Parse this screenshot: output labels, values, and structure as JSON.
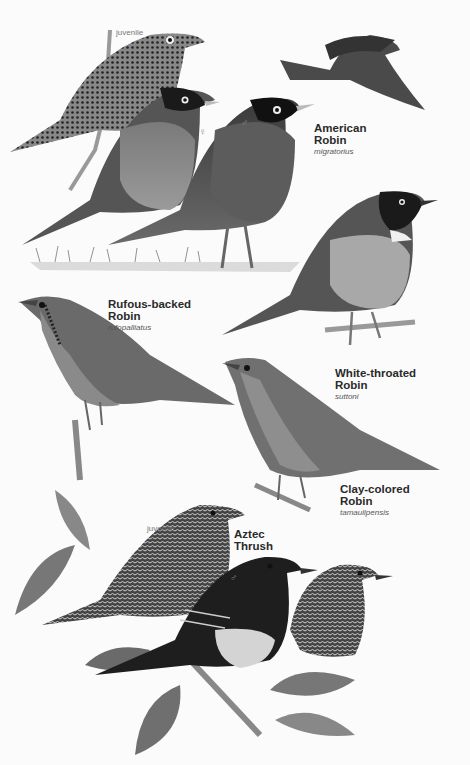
{
  "plate": {
    "background": "#fbfbfb",
    "species": [
      {
        "id": "american-robin",
        "name_line1": "American",
        "name_line2": "Robin",
        "scientific": "migratorius",
        "figures": [
          {
            "variant": "juvenile",
            "tag": "juvenile"
          },
          {
            "variant": "female",
            "symbol": "♀"
          },
          {
            "variant": "male",
            "symbol": "♂"
          },
          {
            "variant": "flight"
          }
        ]
      },
      {
        "id": "rufous-backed-robin",
        "name_line1": "Rufous-backed",
        "name_line2": "Robin",
        "scientific": "rufopalliatus"
      },
      {
        "id": "white-throated-robin",
        "name_line1": "White-throated",
        "name_line2": "Robin",
        "scientific": "suttoni"
      },
      {
        "id": "clay-colored-robin",
        "name_line1": "Clay-colored",
        "name_line2": "Robin",
        "scientific": "tamaulipensis"
      },
      {
        "id": "aztec-thrush",
        "name_line1": "Aztec",
        "name_line2": "Thrush",
        "figures": [
          {
            "variant": "juvenile",
            "tag": "juvenile"
          },
          {
            "variant": "male",
            "symbol": "♂"
          },
          {
            "variant": "female",
            "symbol": "♀"
          }
        ]
      }
    ]
  }
}
